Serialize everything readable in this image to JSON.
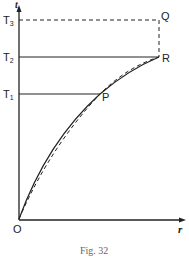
{
  "figure": {
    "caption": "Fig. 32",
    "axes": {
      "y_label": "t",
      "x_label": "r",
      "origin_label": "O"
    },
    "y_ticks": [
      {
        "name": "T",
        "sub": "3"
      },
      {
        "name": "T",
        "sub": "2"
      },
      {
        "name": "T",
        "sub": "1"
      }
    ],
    "points": {
      "P": "P",
      "Q": "Q",
      "R": "R"
    },
    "colors": {
      "ink": "#222222",
      "caption": "#666666",
      "background": "#ffffff"
    }
  }
}
